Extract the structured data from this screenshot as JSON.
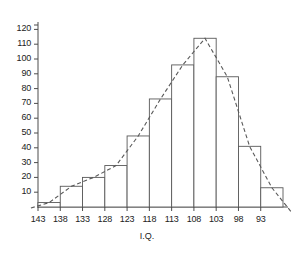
{
  "chart_data": {
    "type": "bar",
    "title": "",
    "subtitle": "",
    "xlabel": "I.Q.",
    "ylabel": "",
    "grid": false,
    "legend": false,
    "xlim": [
      145.5,
      90.5
    ],
    "ylim": [
      0,
      125
    ],
    "x_axis_direction": "descending",
    "x_tick_labels": [
      "143",
      "138",
      "133",
      "128",
      "123",
      "118",
      "113",
      "108",
      "103",
      "98",
      "93"
    ],
    "y_tick_labels": [
      "10",
      "20",
      "30",
      "40",
      "50",
      "60",
      "70",
      "80",
      "90",
      "100",
      "110",
      "120"
    ],
    "y_ticks": [
      10,
      20,
      30,
      40,
      50,
      60,
      70,
      80,
      90,
      100,
      110,
      120
    ],
    "y_tick_interval": 10,
    "bin_edges_labels": [
      "143",
      "138",
      "133",
      "128",
      "123",
      "118",
      "113",
      "108",
      "103",
      "98",
      "93"
    ],
    "categories": [
      "143",
      "138",
      "133",
      "128",
      "123",
      "118",
      "113",
      "108",
      "103",
      "98",
      "93"
    ],
    "values": [
      3,
      14,
      20,
      28,
      48,
      73,
      96,
      114,
      88,
      41,
      13
    ],
    "series": [
      {
        "name": "Frequency histogram",
        "style": "bars-outline",
        "values": [
          3,
          14,
          20,
          28,
          48,
          73,
          96,
          114,
          88,
          41,
          13
        ]
      },
      {
        "name": "Frequency polygon",
        "style": "dashed-curve",
        "values": [
          3,
          14,
          20,
          28,
          48,
          73,
          96,
          114,
          88,
          41,
          13
        ]
      }
    ],
    "annotations": [],
    "colors": {
      "bar_outline": "#595959",
      "bar_fill": "#ffffff",
      "curve": "#595959",
      "axis": "#4d4d4d",
      "text": "#222222",
      "background": "#ffffff"
    }
  },
  "axis_title": {
    "x": "I.Q."
  }
}
